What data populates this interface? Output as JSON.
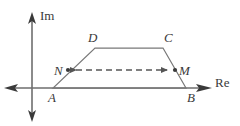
{
  "figure": {
    "background_color": "#ffffff",
    "axes": {
      "real_axis_label": "Re",
      "imaginary_axis_label": "Im",
      "axis_color": "#555555",
      "origin": {
        "x": 30,
        "y": 88
      },
      "real_axis": {
        "x1": 4,
        "y1": 88,
        "x2": 212,
        "y2": 88,
        "arrow_left": true,
        "arrow_right": true
      },
      "imaginary_axis": {
        "x1": 32,
        "y1": 14,
        "x2": 32,
        "y2": 120,
        "arrow_up": true,
        "arrow_down": true
      }
    },
    "shape": {
      "name": "trapezoid",
      "outline_color": "#777777",
      "vertices": [
        {
          "label": "A",
          "x": 53,
          "y": 88,
          "label_x": 50,
          "label_y": 101
        },
        {
          "label": "B",
          "x": 186,
          "y": 88,
          "label_x": 188,
          "label_y": 101
        },
        {
          "label": "C",
          "x": 163,
          "y": 48,
          "label_x": 164,
          "label_y": 42
        },
        {
          "label": "D",
          "x": 95,
          "y": 48,
          "label_x": 90,
          "label_y": 42
        }
      ]
    },
    "midline": {
      "name": "NM-segment",
      "style": "dashed",
      "color": "#555555",
      "dash_pattern": "6 4",
      "start": {
        "label": "N",
        "x": 68,
        "y": 70,
        "label_x": 56,
        "label_y": 75
      },
      "end": {
        "label": "M",
        "x": 175,
        "y": 70,
        "label_x": 178,
        "label_y": 75
      },
      "arrow_start": true,
      "arrow_end": true,
      "point_marker_radius": 2
    }
  }
}
